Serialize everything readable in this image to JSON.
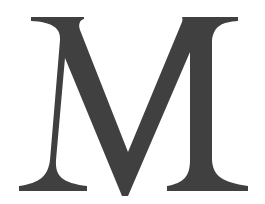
{
  "image": {
    "width": 265,
    "height": 204,
    "background": "#ffffff"
  },
  "glyph": {
    "character": "M",
    "style": "serif capital letter",
    "fill": "#404040"
  }
}
